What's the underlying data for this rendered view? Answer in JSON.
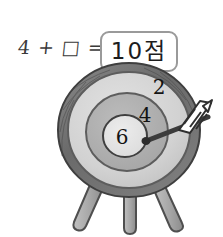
{
  "page": {
    "width": 223,
    "height": 237,
    "background": "#ffffff"
  },
  "equation": {
    "expression": "4 + □ =",
    "operand_left": "4",
    "operator": "+",
    "unknown_box": "□",
    "equals": "=",
    "answer_value": "10점",
    "answer_number": "10",
    "answer_unit": "점",
    "box_border_color": "#9a9a9a"
  },
  "target": {
    "title": "archery-target-on-tripod-stand",
    "rim_color": "#6e6e6e",
    "rings": [
      {
        "label": "2",
        "score": 2,
        "zone": "outer-ring",
        "fill": "#d4d4d4"
      },
      {
        "label": "4",
        "score": 4,
        "zone": "middle-ring",
        "fill": "#b0b0b0"
      },
      {
        "label": "6",
        "score": 6,
        "zone": "bullseye",
        "fill": "#e6e6e6"
      }
    ],
    "arrow": {
      "label": "arrow",
      "shaft_color": "#3c3c3c",
      "fletching_color": "#ffffff",
      "hit_zone": "bullseye-edge",
      "direction": "up-right"
    },
    "stand": {
      "leg_count": 3,
      "leg_color": "#a8a8a8",
      "outline_color": "#5a5a5a"
    }
  }
}
